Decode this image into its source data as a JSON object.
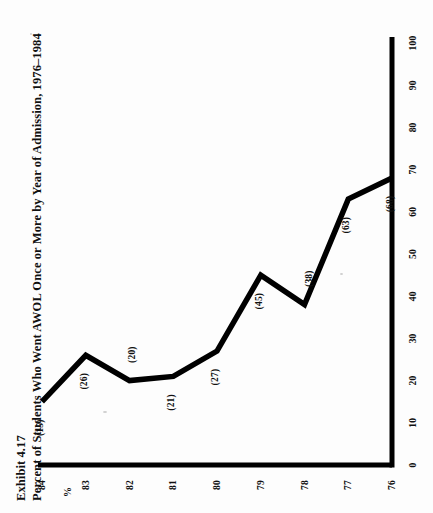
{
  "document": {
    "exhibit_number": "Exhibit 4.17",
    "exhibit_title": "Percent of Students Who Went AWOL Once or More by Year of Admission, 1976–1984"
  },
  "axis_unit_label": "%",
  "chart_data": {
    "type": "line",
    "title": "Percent of Students Who Went AWOL Once or More by Year of Admission, 1976–1984",
    "subtitle": "Exhibit 4.17",
    "xlabel": "",
    "ylabel": "%",
    "categories": [
      "76",
      "77",
      "78",
      "79",
      "80",
      "81",
      "82",
      "83",
      "84"
    ],
    "x_tick_labels": [
      "76",
      "77",
      "78",
      "79",
      "80",
      "81",
      "82",
      "83",
      "84"
    ],
    "y_tick_labels": [
      "0",
      "10",
      "20",
      "30",
      "40",
      "50",
      "60",
      "70",
      "80",
      "90",
      "100"
    ],
    "values": [
      68,
      63,
      38,
      45,
      27,
      21,
      20,
      26,
      15
    ],
    "point_labels": [
      "(68)",
      "(63)",
      "(38)",
      "(45)",
      "(27)",
      "(21)",
      "(20)",
      "(26)",
      "(15)"
    ],
    "ylim": [
      0,
      100
    ],
    "ytick_step": 10,
    "grid": false,
    "legend": false,
    "series": [
      {
        "name": "Percent AWOL once or more",
        "values": [
          68,
          63,
          38,
          45,
          27,
          21,
          20,
          26,
          15
        ]
      }
    ],
    "line_color": "#000000",
    "axis_color": "#000000",
    "background_color": "#fdfdfd"
  }
}
